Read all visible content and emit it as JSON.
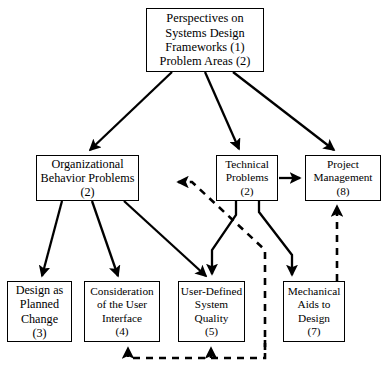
{
  "diagram": {
    "type": "flow-chart",
    "background_color": "#ffffff",
    "line_color": "#000000",
    "nodes": [
      {
        "id": "root",
        "lines": [
          "Perspectives on",
          "Systems Design",
          "Frameworks (1)",
          "Problem Areas (2)"
        ],
        "number": "1",
        "x": 146,
        "y": 8,
        "w": 118,
        "h": 64
      },
      {
        "id": "organizational",
        "lines": [
          "Organizational",
          "Behavior Problems",
          "(2)"
        ],
        "number": "2",
        "x": 36,
        "y": 155,
        "w": 103,
        "h": 46
      },
      {
        "id": "technical",
        "lines": [
          "Technical",
          "Problems",
          "(2)"
        ],
        "number": "2",
        "x": 216,
        "y": 155,
        "w": 62,
        "h": 46
      },
      {
        "id": "project",
        "lines": [
          "Project",
          "Management",
          "(8)"
        ],
        "number": "8",
        "x": 305,
        "y": 155,
        "w": 76,
        "h": 46
      },
      {
        "id": "design",
        "lines": [
          "Design as",
          "Planned",
          "Change",
          "(3)"
        ],
        "number": "3",
        "x": 7,
        "y": 281,
        "w": 65,
        "h": 61
      },
      {
        "id": "interface",
        "lines": [
          "Consideration",
          "of the User",
          "Interface",
          "(4)"
        ],
        "number": "4",
        "x": 84,
        "y": 281,
        "w": 76,
        "h": 61
      },
      {
        "id": "quality",
        "lines": [
          "User-Defined",
          "System",
          "Quality",
          "(5)"
        ],
        "number": "5",
        "x": 178,
        "y": 281,
        "w": 67,
        "h": 61
      },
      {
        "id": "mechanical",
        "lines": [
          "Mechanical",
          "Aids to",
          "Design",
          "(7)"
        ],
        "number": "7",
        "x": 283,
        "y": 281,
        "w": 62,
        "h": 61
      }
    ],
    "edges": [
      {
        "id": "root-to-organizational",
        "from": "root",
        "to": "organizational",
        "style": "solid",
        "arrow": "end"
      },
      {
        "id": "root-to-technical",
        "from": "root",
        "to": "technical",
        "style": "solid",
        "arrow": "end"
      },
      {
        "id": "root-to-project",
        "from": "root",
        "to": "project",
        "style": "solid",
        "arrow": "end"
      },
      {
        "id": "organizational-to-design",
        "from": "organizational",
        "to": "design",
        "style": "solid",
        "arrow": "end"
      },
      {
        "id": "organizational-to-interface",
        "from": "organizational",
        "to": "interface",
        "style": "solid",
        "arrow": "end"
      },
      {
        "id": "organizational-to-quality",
        "from": "organizational",
        "to": "quality",
        "style": "solid",
        "arrow": "end"
      },
      {
        "id": "technical-to-project",
        "from": "technical",
        "to": "project",
        "style": "solid",
        "arrow": "end"
      },
      {
        "id": "technical-to-quality",
        "from": "technical",
        "to": "quality",
        "style": "solid",
        "arrow": "end"
      },
      {
        "id": "technical-to-mechanical",
        "from": "technical",
        "to": "mechanical",
        "style": "solid",
        "arrow": "end"
      },
      {
        "id": "feedback-to-technical",
        "from": "quality",
        "to": "technical",
        "style": "dashed",
        "arrow": "end"
      },
      {
        "id": "feedback-to-interface",
        "from": "mechanical",
        "to": "interface",
        "style": "dashed",
        "arrow": "end"
      },
      {
        "id": "feedback-to-quality",
        "from": "mechanical",
        "to": "quality",
        "style": "dashed",
        "arrow": "end"
      },
      {
        "id": "mechanical-to-project",
        "from": "mechanical",
        "to": "project",
        "style": "dashed",
        "arrow": "end"
      }
    ]
  }
}
